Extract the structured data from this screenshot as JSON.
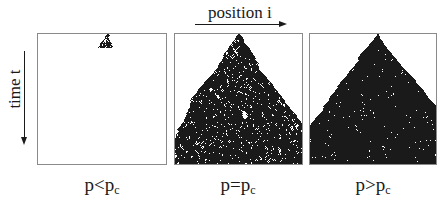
{
  "axes": {
    "horizontal": {
      "label": "position i",
      "direction": "right"
    },
    "vertical": {
      "label": "time t",
      "direction": "down"
    }
  },
  "panels": [
    {
      "id": "subcritical",
      "caption_main": "p<p",
      "caption_sub": "c",
      "regime": "p < p_c",
      "description": "small cluster dies out near the top",
      "density": "sparse",
      "extent_rows": 14,
      "seed": 7,
      "prob": 0.52
    },
    {
      "id": "critical",
      "caption_main": "p=p",
      "caption_sub": "c",
      "regime": "p = p_c",
      "description": "fractal branching cluster spanning the full time range",
      "density": "filamentary",
      "extent_rows": 130,
      "seed": 11,
      "prob": 0.6447
    },
    {
      "id": "supercritical",
      "caption_main": "p>p",
      "caption_sub": "c",
      "regime": "p > p_c",
      "description": "dense cone-shaped cluster spreading to fill the lattice",
      "density": "dense",
      "extent_rows": 130,
      "seed": 3,
      "prob": 0.78
    }
  ],
  "colors": {
    "ink": "#1a1a1a",
    "frame": "#8a8a8a",
    "background": "#ffffff"
  }
}
